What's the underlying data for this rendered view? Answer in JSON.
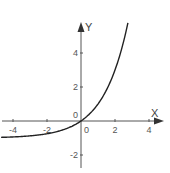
{
  "chart_data": {
    "type": "line",
    "title": "",
    "xlabel": "X",
    "ylabel": "Y",
    "function": "y = 2^x - 1",
    "xlim": [
      -4.7,
      4.7
    ],
    "ylim": [
      -2.8,
      6.0
    ],
    "x_ticks": [
      -4,
      -2,
      0,
      2,
      4
    ],
    "y_ticks": [
      -2,
      2,
      4
    ],
    "x_tick_labels": [
      "-4",
      "-2",
      "0",
      "2",
      "4"
    ],
    "y_tick_labels": [
      "-2",
      "2",
      "4"
    ],
    "origin_label": "0",
    "grid": false,
    "legend": null,
    "series": [
      {
        "name": "curve",
        "x": [
          -4.7,
          -4,
          -3,
          -2,
          -1,
          -0.5,
          0,
          0.5,
          1,
          1.5,
          2,
          2.5,
          2.76
        ],
        "values": [
          -0.96,
          -0.94,
          -0.88,
          -0.75,
          -0.5,
          -0.29,
          0,
          0.41,
          1,
          1.83,
          3,
          4.66,
          5.77
        ],
        "color": "#222222"
      }
    ],
    "colors": {
      "axis": "#555555",
      "curve": "#222222",
      "background": "#ffffff"
    }
  }
}
